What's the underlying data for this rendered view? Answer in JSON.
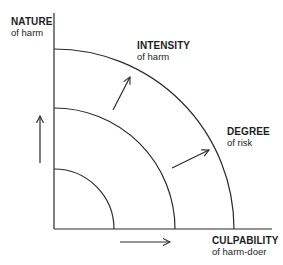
{
  "diagram": {
    "axes": {
      "y_axis": {
        "main": "NATURE",
        "sub": "of harm"
      },
      "x_axis": {
        "main": "CULPABILITY",
        "sub": "of harm-doer"
      }
    },
    "region_labels": {
      "intensity": {
        "main": "INTENSITY",
        "sub": "of harm"
      },
      "degree": {
        "main": "DEGREE",
        "sub": "of risk"
      }
    },
    "arcs": [
      {
        "name": "inner",
        "radius": 60
      },
      {
        "name": "middle",
        "radius": 121
      },
      {
        "name": "outer",
        "radius": 180
      }
    ],
    "arrows": [
      {
        "name": "up-arrow",
        "direction": "up"
      },
      {
        "name": "right-arrow",
        "direction": "right"
      },
      {
        "name": "intensity-arrow",
        "direction": "up-right"
      },
      {
        "name": "degree-arrow",
        "direction": "up-right"
      }
    ],
    "colors": {
      "line": "#2a2a2a",
      "text": "#1e1e1e",
      "background": "#ffffff"
    }
  }
}
